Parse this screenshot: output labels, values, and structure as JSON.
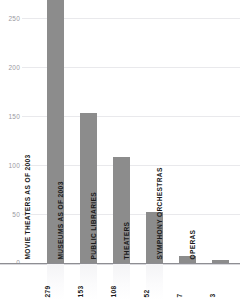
{
  "chart_data": {
    "type": "bar",
    "title": "",
    "xlabel": "",
    "ylabel": "",
    "categories": [
      "MOVIE THEATERS AS OF 2003",
      "MUSEUMS AS OF 2003",
      "PUBLIC LIBRARIES",
      "THEATERS",
      "SYMPHONY ORCHESTRAS",
      "OPERAS"
    ],
    "values": [
      279,
      153,
      108,
      52,
      7,
      3
    ],
    "value_labels": [
      "279",
      "153",
      "108",
      "52",
      "7",
      "3"
    ],
    "ylim": [
      0,
      290
    ],
    "yticks": [
      0,
      50,
      100,
      150,
      200,
      250
    ],
    "ytick_labels": [
      "0",
      "50",
      "100",
      "150",
      "200",
      "250"
    ],
    "grid": true,
    "legend": false,
    "orientation": "vertical",
    "bar_color": "#8c8c8c",
    "grid_color": "#e9e9ec",
    "axis_color": "#8e8e93",
    "tick_label_color": "#9a9a9f",
    "label_color": "#1b1b1b",
    "background": "#ffffff"
  }
}
